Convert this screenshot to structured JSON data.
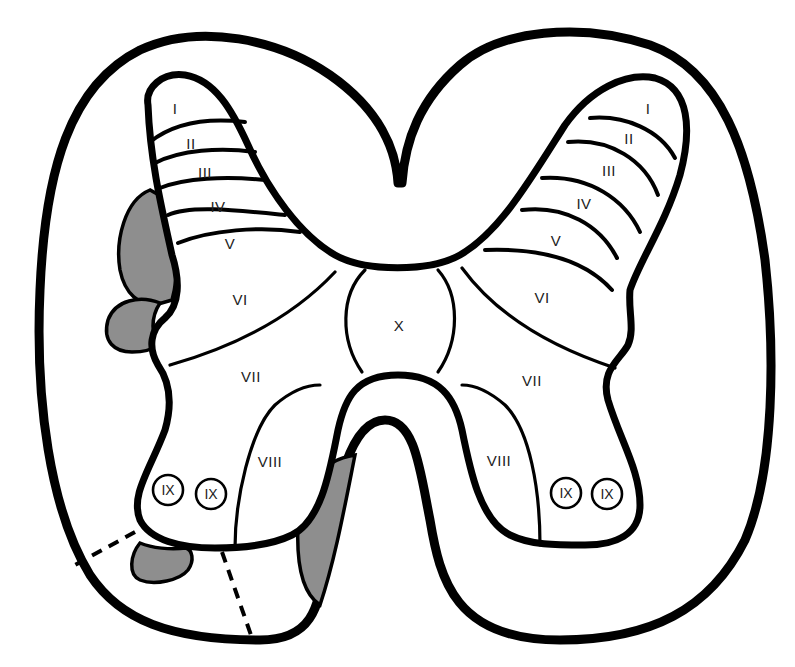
{
  "diagram": {
    "colors": {
      "outline": "#000000",
      "background": "#ffffff",
      "shaded_regions": "#8e8e8e",
      "label_text": "#222222"
    },
    "left_horn_labels": {
      "l1": "I",
      "l2": "II",
      "l3": "III",
      "l4": "IV",
      "l5": "V",
      "l6": "VI",
      "l7": "VII",
      "l8": "VIII",
      "l9a": "IX",
      "l9b": "IX"
    },
    "right_horn_labels": {
      "l1": "I",
      "l2": "II",
      "l3": "III",
      "l4": "IV",
      "l5": "V",
      "l6": "VI",
      "l7": "VII",
      "l8": "VIII",
      "l9a": "IX",
      "l9b": "IX"
    },
    "central_label": "X",
    "shaded_region_count": 4,
    "dashed_line_count": 2
  }
}
